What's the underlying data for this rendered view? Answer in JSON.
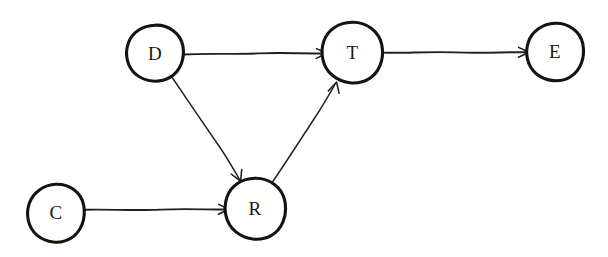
{
  "diagram": {
    "style": "hand-drawn sketch",
    "background_color": "#ffffff",
    "stroke_color": "#16130f",
    "canvas": {
      "width": 608,
      "height": 257
    },
    "nodes": [
      {
        "id": "D",
        "label": "D",
        "cx": 155,
        "cy": 53,
        "r": 28
      },
      {
        "id": "T",
        "label": "T",
        "cx": 352,
        "cy": 52,
        "r": 30
      },
      {
        "id": "E",
        "label": "E",
        "cx": 555,
        "cy": 51,
        "r": 28
      },
      {
        "id": "C",
        "label": "C",
        "cx": 56,
        "cy": 212,
        "r": 28
      },
      {
        "id": "R",
        "label": "R",
        "cx": 255,
        "cy": 208,
        "r": 30
      }
    ],
    "edges": [
      {
        "id": "D-T",
        "from": "D",
        "to": "T",
        "directed": true,
        "orientation": "horizontal"
      },
      {
        "id": "T-E",
        "from": "T",
        "to": "E",
        "directed": true,
        "orientation": "horizontal"
      },
      {
        "id": "D-R",
        "from": "D",
        "to": "R",
        "directed": true,
        "orientation": "diagonal-down-right"
      },
      {
        "id": "R-T",
        "from": "R",
        "to": "T",
        "directed": true,
        "orientation": "diagonal-up-right"
      },
      {
        "id": "C-R",
        "from": "C",
        "to": "R",
        "directed": true,
        "orientation": "horizontal"
      }
    ]
  }
}
